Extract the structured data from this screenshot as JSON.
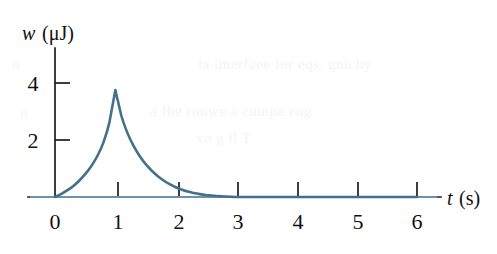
{
  "figure": {
    "background_color": "#ffffff",
    "curve_color": "#45708a",
    "axis_color": "#1c1c1c",
    "ghost_text": {
      "line1": "la imerfaee for eqs. gnichy",
      "line2": "a fhe rouwe a cumpe  eng",
      "line3": "xo   g  il  T",
      "line4": "o",
      "line5": "u"
    }
  },
  "chart_data": {
    "type": "line",
    "title": "",
    "xlabel": "t (s)",
    "ylabel": "w (μJ)",
    "ylabel_symbol": "w",
    "ylabel_units": "(μJ)",
    "xlabel_symbol": "t",
    "xlabel_units": "(s)",
    "xlim": [
      0,
      6.4
    ],
    "ylim": [
      0,
      5.2
    ],
    "xticks": [
      0,
      1,
      2,
      3,
      4,
      5,
      6
    ],
    "xtick_labels": [
      "0",
      "1",
      "2",
      "3",
      "4",
      "5",
      "6"
    ],
    "yticks": [
      2,
      4
    ],
    "ytick_labels": [
      "2",
      "4"
    ],
    "grid": false,
    "legend": null,
    "peak": {
      "x": 1,
      "y": 3.75
    },
    "x": [
      0,
      0.1,
      0.2,
      0.3,
      0.4,
      0.5,
      0.6,
      0.7,
      0.8,
      0.9,
      1.0,
      1.1,
      1.2,
      1.3,
      1.4,
      1.5,
      1.6,
      1.7,
      1.8,
      1.9,
      2.0,
      2.1,
      2.2,
      2.3,
      2.4,
      2.5,
      2.6,
      2.7,
      2.8,
      2.9,
      3.0,
      3.5,
      4.0,
      4.5,
      5.0,
      5.5,
      6.0
    ],
    "y": [
      0.0,
      0.1,
      0.23,
      0.38,
      0.57,
      0.8,
      1.08,
      1.43,
      1.9,
      2.6,
      3.75,
      2.85,
      2.25,
      1.8,
      1.45,
      1.16,
      0.93,
      0.74,
      0.58,
      0.45,
      0.34,
      0.26,
      0.19,
      0.14,
      0.1,
      0.07,
      0.05,
      0.03,
      0.02,
      0.01,
      0.0,
      0.0,
      0.0,
      0.0,
      0.0,
      0.0,
      0.0
    ]
  }
}
